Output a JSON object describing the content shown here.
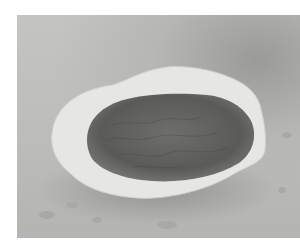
{
  "image": {
    "subject": "broken eggshell-like bowl with dark textured interior on gray surface",
    "colors": {
      "background": "#ffffff",
      "surface": "#bdbdbb",
      "shell": "#e8e8e6",
      "interior": "#5e5e5c"
    }
  }
}
